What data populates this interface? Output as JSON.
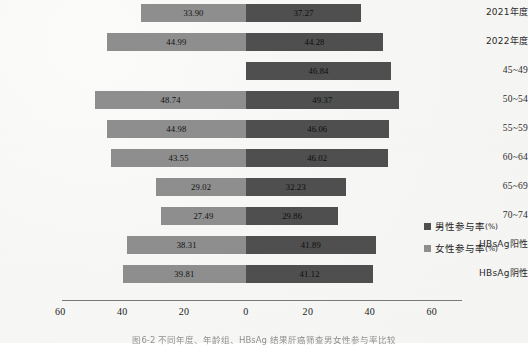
{
  "chart_data": {
    "type": "bar",
    "subtype": "diverging-horizontal-butterfly",
    "title": "",
    "xlabel": "",
    "ylabel": "",
    "xlim": [
      -60,
      60
    ],
    "grid": false,
    "legend_position": "right",
    "categories": [
      "2021年度",
      "2022年度",
      "45~49",
      "50~54",
      "55~59",
      "60~64",
      "65~69",
      "70~74",
      "HBsAg阳性",
      "HBsAg阴性"
    ],
    "series": [
      {
        "name": "女性参与率(%)",
        "side": "left",
        "color": "#8e8e8e",
        "values": [
          33.9,
          44.99,
          null,
          48.74,
          44.98,
          43.55,
          29.02,
          27.49,
          38.31,
          39.81
        ],
        "labels": [
          "33.90",
          "44.99",
          "",
          "48.74",
          "44.98",
          "43.55",
          "29.02",
          "27.49",
          "38.31",
          "39.81"
        ]
      },
      {
        "name": "男性参与率(%)",
        "side": "right",
        "color": "#4f4f4f",
        "values": [
          37.27,
          44.28,
          46.84,
          49.37,
          46.06,
          46.02,
          32.23,
          29.86,
          41.89,
          41.12
        ],
        "labels": [
          "37.27",
          "44.28",
          "46.84",
          "49.37",
          "46.06",
          "46.02",
          "32.23",
          "29.86",
          "41.89",
          "41.12"
        ]
      }
    ],
    "xticks": [
      "60",
      "40",
      "20",
      "0",
      "20",
      "40",
      "60"
    ],
    "xtick_values": [
      -60,
      -40,
      -20,
      0,
      20,
      40,
      60
    ]
  },
  "legend": {
    "items": [
      {
        "label": "男性参与率",
        "unit": "(%)",
        "color": "#4f4f4f"
      },
      {
        "label": "女性参与率",
        "unit": "(%)",
        "color": "#8e8e8e"
      }
    ]
  },
  "caption": {
    "text": "图6-2  不同年度、年龄组、HBsAg 结果肝癌筛查男女性参与率比较"
  }
}
